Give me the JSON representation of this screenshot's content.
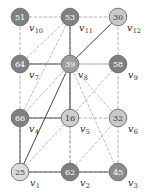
{
  "figure": {
    "type": "graph-diagram",
    "width": 150,
    "height": 193,
    "background": "#ffffff"
  },
  "style": {
    "grid_edge_color": "#a8a8a8",
    "tree_edge_color": "#555555",
    "node_stroke": "#6b6b6b",
    "fill_dark": "#808080",
    "fill_medium": "#9e9e9e",
    "fill_light": "#c9c9c9",
    "fill_lightest": "#dcdcdc",
    "label_color": "#2a2a2a"
  },
  "nodes": [
    {
      "id": "v1",
      "label": "v",
      "sub": "1",
      "value": "25",
      "cx": 20,
      "cy": 172,
      "r": 8.8,
      "fill": "#dcdcdc",
      "text": "light",
      "label_dx": 10,
      "label_dy": 6
    },
    {
      "id": "v2",
      "label": "v",
      "sub": "2",
      "value": "62",
      "cx": 70,
      "cy": 172,
      "r": 8.8,
      "fill": "#808080",
      "text": "dark",
      "label_dx": 10,
      "label_dy": 6
    },
    {
      "id": "v3",
      "label": "v",
      "sub": "3",
      "value": "45",
      "cx": 118,
      "cy": 172,
      "r": 8.8,
      "fill": "#8c8c8c",
      "text": "dark",
      "label_dx": 10,
      "label_dy": 6
    },
    {
      "id": "v4",
      "label": "v",
      "sub": "4",
      "value": "66",
      "cx": 20,
      "cy": 118,
      "r": 8.8,
      "fill": "#808080",
      "text": "dark",
      "label_dx": 9,
      "label_dy": 6
    },
    {
      "id": "v5",
      "label": "v",
      "sub": "5",
      "value": "16",
      "cx": 70,
      "cy": 118,
      "r": 8.8,
      "fill": "#cfcfcf",
      "text": "light",
      "label_dx": 10,
      "label_dy": 6
    },
    {
      "id": "v6",
      "label": "v",
      "sub": "6",
      "value": "32",
      "cx": 118,
      "cy": 118,
      "r": 8.8,
      "fill": "#c9c9c9",
      "text": "light",
      "label_dx": 10,
      "label_dy": 6
    },
    {
      "id": "v7",
      "label": "v",
      "sub": "7",
      "value": "64",
      "cx": 20,
      "cy": 64,
      "r": 8.8,
      "fill": "#808080",
      "text": "dark",
      "label_dx": 9,
      "label_dy": 6
    },
    {
      "id": "v8",
      "label": "v",
      "sub": "8",
      "value": "39",
      "cx": 70,
      "cy": 64,
      "r": 8.8,
      "fill": "#9e9e9e",
      "text": "dark",
      "label_dx": 8,
      "label_dy": 6
    },
    {
      "id": "v9",
      "label": "v",
      "sub": "9",
      "value": "58",
      "cx": 118,
      "cy": 64,
      "r": 8.8,
      "fill": "#808080",
      "text": "dark",
      "label_dx": 10,
      "label_dy": 6
    },
    {
      "id": "v10",
      "label": "v",
      "sub": "10",
      "value": "51",
      "cx": 20,
      "cy": 17,
      "r": 8.8,
      "fill": "#808080",
      "text": "dark",
      "label_dx": 9,
      "label_dy": 6
    },
    {
      "id": "v11",
      "label": "v",
      "sub": "11",
      "value": "53",
      "cx": 70,
      "cy": 17,
      "r": 8.8,
      "fill": "#808080",
      "text": "dark",
      "label_dx": 9,
      "label_dy": 6
    },
    {
      "id": "v12",
      "label": "v",
      "sub": "12",
      "value": "30",
      "cx": 118,
      "cy": 17,
      "r": 8.8,
      "fill": "#c9c9c9",
      "text": "light",
      "label_dx": 9,
      "label_dy": 6
    }
  ],
  "grid_edges": [
    {
      "from": "v1",
      "to": "v2"
    },
    {
      "from": "v2",
      "to": "v3"
    },
    {
      "from": "v4",
      "to": "v5"
    },
    {
      "from": "v5",
      "to": "v6"
    },
    {
      "from": "v7",
      "to": "v8"
    },
    {
      "from": "v8",
      "to": "v9"
    },
    {
      "from": "v10",
      "to": "v11"
    },
    {
      "from": "v11",
      "to": "v12"
    },
    {
      "from": "v1",
      "to": "v4"
    },
    {
      "from": "v4",
      "to": "v7"
    },
    {
      "from": "v7",
      "to": "v10"
    },
    {
      "from": "v2",
      "to": "v5"
    },
    {
      "from": "v5",
      "to": "v8"
    },
    {
      "from": "v8",
      "to": "v11"
    },
    {
      "from": "v3",
      "to": "v6"
    },
    {
      "from": "v6",
      "to": "v9"
    },
    {
      "from": "v9",
      "to": "v12"
    }
  ],
  "diagonal_edges": [
    {
      "from": "v1",
      "to": "v8"
    },
    {
      "from": "v2",
      "to": "v8"
    },
    {
      "from": "v4",
      "to": "v8"
    },
    {
      "from": "v4",
      "to": "v11"
    },
    {
      "from": "v5",
      "to": "v8"
    },
    {
      "from": "v6",
      "to": "v8"
    },
    {
      "from": "v7",
      "to": "v11"
    },
    {
      "from": "v8",
      "to": "v12"
    },
    {
      "from": "v9",
      "to": "v8"
    },
    {
      "from": "v1",
      "to": "v5"
    },
    {
      "from": "v2",
      "to": "v6"
    },
    {
      "from": "v5",
      "to": "v9"
    },
    {
      "from": "v3",
      "to": "v8"
    }
  ],
  "tree_edges": [
    {
      "from": "v7",
      "to": "v8"
    },
    {
      "from": "v8",
      "to": "v5"
    },
    {
      "from": "v5",
      "to": "v4"
    },
    {
      "from": "v8",
      "to": "v11"
    },
    {
      "from": "v8",
      "to": "v12"
    },
    {
      "from": "v4",
      "to": "v1"
    },
    {
      "from": "v1",
      "to": "v2"
    },
    {
      "from": "v2",
      "to": "v3"
    },
    {
      "from": "v1",
      "to": "v8"
    }
  ]
}
